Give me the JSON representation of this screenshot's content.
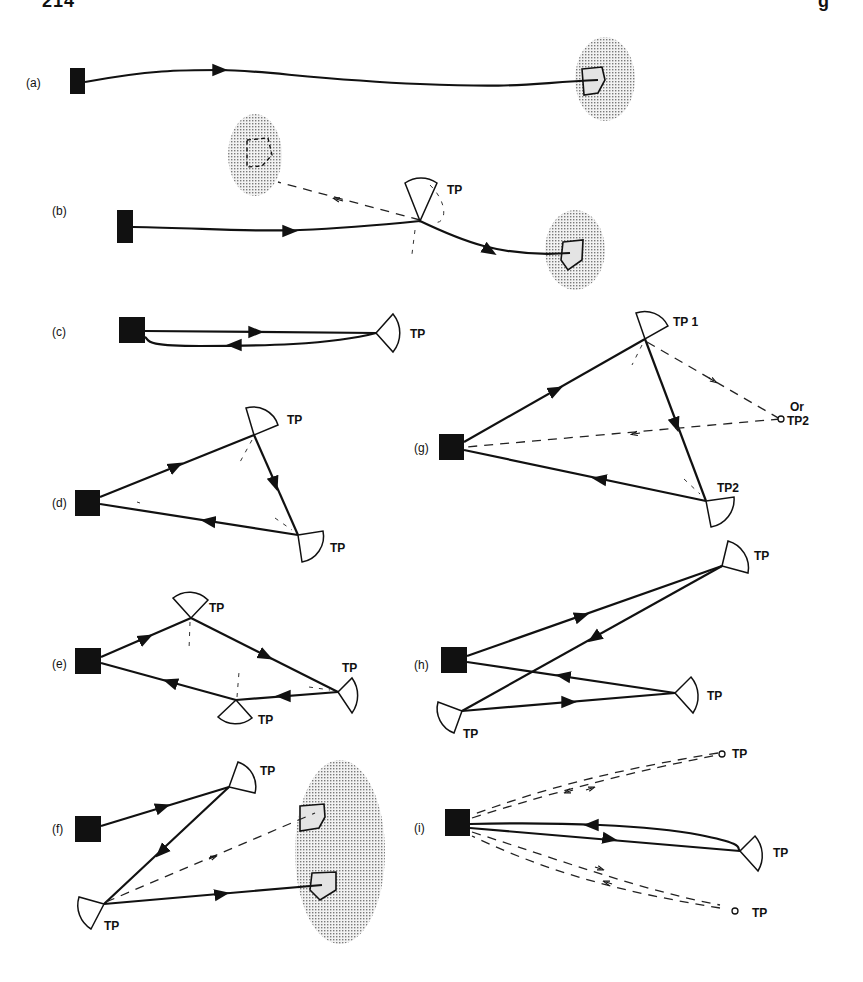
{
  "page_header": {
    "left_fragment": "214",
    "right_fragment": "g"
  },
  "figure": {
    "legend": {
      "transmitter": "filled square",
      "turning_point": "TP (fan-shaped reflector)",
      "target_area": "stippled region"
    },
    "panels": [
      {
        "id": "a",
        "label": "(a)",
        "tp_labels": []
      },
      {
        "id": "b",
        "label": "(b)",
        "tp_labels": [
          "TP"
        ]
      },
      {
        "id": "c",
        "label": "(c)",
        "tp_labels": [
          "TP"
        ]
      },
      {
        "id": "d",
        "label": "(d)",
        "tp_labels": [
          "TP",
          "TP"
        ]
      },
      {
        "id": "e",
        "label": "(e)",
        "tp_labels": [
          "TP",
          "TP",
          "TP"
        ]
      },
      {
        "id": "f",
        "label": "(f)",
        "tp_labels": [
          "TP",
          "TP"
        ]
      },
      {
        "id": "g",
        "label": "(g)",
        "tp_labels": [
          "TP 1",
          "TP2"
        ],
        "alt_label_line1": "Or",
        "alt_label_line2": "TP2"
      },
      {
        "id": "h",
        "label": "(h)",
        "tp_labels": [
          "TP",
          "TP",
          "TP"
        ]
      },
      {
        "id": "i",
        "label": "(i)",
        "tp_labels": [
          "TP",
          "TP",
          "TP"
        ]
      }
    ]
  }
}
